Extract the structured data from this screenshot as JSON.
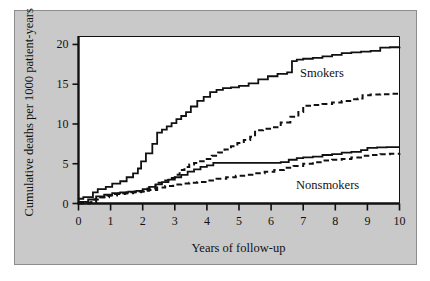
{
  "figure": {
    "background_color": "#ffffff",
    "panel_color": "#c9c9c9",
    "plot_background_color": "#ffffff",
    "line_color": "#111111"
  },
  "chart_data": {
    "type": "line",
    "title": "",
    "subtitle": "",
    "xlabel": "Years of follow-up",
    "ylabel": "Cumulative deaths per 1000 patient-years",
    "xlim": [
      0,
      10
    ],
    "ylim": [
      0,
      21
    ],
    "xticks": [
      0,
      1,
      2,
      3,
      4,
      5,
      6,
      7,
      8,
      9,
      10
    ],
    "xtick_labels": [
      "0",
      "1",
      "2",
      "3",
      "4",
      "5",
      "6",
      "7",
      "8",
      "9",
      "10"
    ],
    "yticks": [
      0,
      5,
      10,
      15,
      20
    ],
    "ytick_labels": [
      "0",
      "5",
      "10",
      "15",
      "20"
    ],
    "grid": false,
    "legend_position": "inline-annotation",
    "step_style": "post",
    "annotations": [
      {
        "text": "Smokers",
        "x": 7.0,
        "y": 17.0
      },
      {
        "text": "Nonsmokers",
        "x": 6.9,
        "y": 3.1
      }
    ],
    "series": [
      {
        "name": "Smokers - solid",
        "style": "solid",
        "x": [
          0,
          0.15,
          0.45,
          0.6,
          0.85,
          1.05,
          1.3,
          1.5,
          1.7,
          1.85,
          1.95,
          2.1,
          2.3,
          2.45,
          2.6,
          2.75,
          2.9,
          3.05,
          3.2,
          3.35,
          3.5,
          3.7,
          3.9,
          4.1,
          4.3,
          4.5,
          4.75,
          5.0,
          5.3,
          5.6,
          5.9,
          6.2,
          6.5,
          6.65,
          6.8,
          7.0,
          7.3,
          7.6,
          7.9,
          8.2,
          8.5,
          8.8,
          9.1,
          9.4,
          9.7,
          10.0
        ],
        "y": [
          0.6,
          0.8,
          1.4,
          1.8,
          2.1,
          2.5,
          2.8,
          3.3,
          3.8,
          4.4,
          5.3,
          6.3,
          7.5,
          8.9,
          9.3,
          9.7,
          10.1,
          10.6,
          11.0,
          11.5,
          12.2,
          12.9,
          13.4,
          14.0,
          14.3,
          14.5,
          14.6,
          14.8,
          15.1,
          15.6,
          16.0,
          16.3,
          16.5,
          17.9,
          18.1,
          18.2,
          18.3,
          18.5,
          18.7,
          18.9,
          19.0,
          19.1,
          19.2,
          19.6,
          19.65,
          19.7
        ]
      },
      {
        "name": "Smokers - dashed",
        "style": "dashed",
        "x": [
          0,
          0.4,
          0.7,
          0.95,
          1.2,
          1.45,
          1.7,
          1.95,
          2.15,
          2.4,
          2.6,
          2.8,
          3.0,
          3.15,
          3.3,
          3.45,
          3.6,
          3.75,
          3.95,
          4.15,
          4.35,
          4.55,
          4.75,
          4.95,
          5.15,
          5.35,
          5.5,
          5.75,
          6.0,
          6.3,
          6.6,
          6.85,
          7.0,
          7.3,
          7.6,
          7.9,
          8.2,
          8.5,
          8.7,
          8.85,
          9.1,
          9.4,
          9.7,
          10.0
        ],
        "y": [
          0.1,
          0.5,
          0.8,
          1.0,
          1.2,
          1.3,
          1.4,
          1.5,
          1.9,
          2.6,
          2.9,
          3.2,
          3.6,
          4.2,
          4.6,
          4.9,
          5.1,
          5.3,
          5.6,
          6.0,
          6.4,
          6.8,
          7.2,
          7.6,
          8.0,
          8.4,
          9.2,
          9.4,
          9.6,
          10.2,
          10.9,
          11.5,
          12.3,
          12.4,
          12.5,
          12.7,
          12.9,
          13.1,
          13.2,
          13.6,
          13.7,
          13.75,
          13.8,
          13.8
        ]
      },
      {
        "name": "Nonsmokers - solid",
        "style": "solid",
        "x": [
          0,
          0.3,
          0.55,
          0.8,
          1.05,
          1.3,
          1.55,
          1.8,
          2.0,
          2.2,
          2.4,
          2.6,
          2.8,
          3.0,
          3.2,
          3.4,
          3.6,
          3.8,
          4.0,
          4.2,
          4.6,
          5.0,
          5.5,
          6.0,
          6.3,
          6.55,
          6.8,
          7.0,
          7.3,
          7.6,
          7.9,
          8.2,
          8.5,
          8.8,
          9.0,
          9.3,
          9.6,
          10.0
        ],
        "y": [
          0.2,
          0.5,
          0.9,
          1.1,
          1.3,
          1.4,
          1.5,
          1.6,
          1.8,
          2.1,
          2.4,
          2.7,
          3.0,
          3.3,
          3.6,
          4.0,
          4.3,
          4.6,
          4.8,
          5.1,
          5.1,
          5.1,
          5.1,
          5.1,
          5.2,
          5.5,
          5.7,
          5.8,
          5.9,
          6.1,
          6.2,
          6.4,
          6.5,
          6.7,
          7.0,
          7.05,
          7.1,
          7.1
        ]
      },
      {
        "name": "Nonsmokers - dashed",
        "style": "dashed",
        "x": [
          0,
          0.35,
          0.55,
          0.8,
          1.0,
          1.25,
          1.5,
          1.75,
          2.0,
          2.2,
          2.45,
          2.7,
          2.95,
          3.2,
          3.45,
          3.7,
          4.0,
          4.3,
          4.6,
          4.9,
          5.2,
          5.5,
          5.8,
          6.1,
          6.4,
          6.7,
          7.0,
          7.3,
          7.6,
          7.9,
          8.2,
          8.5,
          8.8,
          9.1,
          9.4,
          9.7,
          10.0
        ],
        "y": [
          0.0,
          0.1,
          0.8,
          1.0,
          1.2,
          1.3,
          1.4,
          1.5,
          1.6,
          1.7,
          2.0,
          2.2,
          2.4,
          2.5,
          2.6,
          2.7,
          2.9,
          3.1,
          3.3,
          3.5,
          3.6,
          3.8,
          4.0,
          4.2,
          4.5,
          4.7,
          5.0,
          5.2,
          5.4,
          5.5,
          5.6,
          5.8,
          6.0,
          6.1,
          6.2,
          6.25,
          6.3
        ]
      }
    ]
  }
}
